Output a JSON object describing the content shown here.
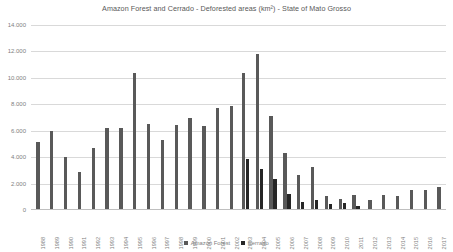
{
  "chart_data": {
    "type": "bar",
    "title": "Amazon Forest and Cerrado - Deforested areas (km²) - State of Mato Grosso",
    "xlabel": "",
    "ylabel": "",
    "ylim": [
      0,
      14000
    ],
    "ytick_labels": [
      "14.000",
      "12.000",
      "10.000",
      "8.000",
      "6.000",
      "4.000",
      "2.000",
      "0"
    ],
    "ytick_values": [
      14000,
      12000,
      10000,
      8000,
      6000,
      4000,
      2000,
      0
    ],
    "grid": true,
    "legend_position": "bottom",
    "categories": [
      "1988",
      "1989",
      "1990",
      "1991",
      "1992",
      "1993",
      "1994",
      "1995",
      "1996",
      "1997",
      "1998",
      "1999",
      "2000",
      "2001",
      "2002",
      "2003",
      "2004",
      "2005",
      "2006",
      "2007",
      "2008",
      "2009",
      "2010",
      "2011",
      "2012",
      "2013",
      "2014",
      "2015",
      "2016",
      "2017"
    ],
    "series": [
      {
        "name": "Amazon Forest",
        "color": "#595959",
        "values": [
          5140,
          5960,
          4020,
          2840,
          4670,
          6220,
          6220,
          10390,
          6540,
          5270,
          6460,
          6960,
          6370,
          7700,
          7890,
          10400,
          11810,
          7150,
          4330,
          2680,
          3260,
          1050,
          870,
          1120,
          760,
          1140,
          1080,
          1510,
          1490,
          1760
        ]
      },
      {
        "name": "Cerrado",
        "color": "#262626",
        "values": [
          0,
          0,
          0,
          0,
          0,
          0,
          0,
          0,
          0,
          0,
          0,
          0,
          0,
          0,
          0,
          3870,
          3090,
          2340,
          1230,
          640,
          760,
          440,
          540,
          300,
          0,
          0,
          0,
          0,
          0,
          0
        ]
      }
    ]
  },
  "legend": {
    "entries": [
      {
        "label": "Amazon Forest",
        "color": "#595959"
      },
      {
        "label": "Cerrado",
        "color": "#262626"
      }
    ]
  }
}
